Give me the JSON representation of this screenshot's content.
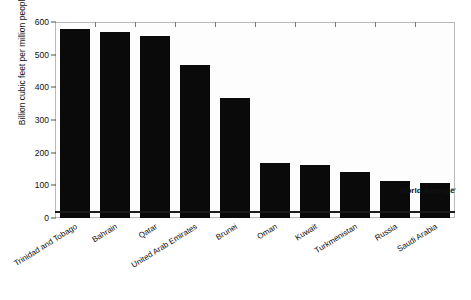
{
  "chart_data": {
    "type": "bar",
    "title": "",
    "subtitle": "",
    "xlabel": "",
    "ylabel": "Billion cubic feet per million people",
    "ylim": [
      0,
      600
    ],
    "yticks": [
      0,
      100,
      200,
      300,
      400,
      500,
      600
    ],
    "grid": false,
    "legend_position": "none",
    "orientation": "vertical",
    "bar_color": "#0a0a0a",
    "plot_background": "#fdfdfd",
    "frame_color": "#b9b9b9",
    "categories": [
      "Trinidad and Tobago",
      "Bahrain",
      "Qatar",
      "United Arab Emirates",
      "Brunei",
      "Oman",
      "Kuwait",
      "Turkmenistan",
      "Russia",
      "Saudi Arabia"
    ],
    "values": [
      580,
      568,
      557,
      468,
      368,
      168,
      162,
      141,
      113,
      107
    ],
    "annotations": [
      {
        "name": "world-average",
        "label": "World Average",
        "type": "hline",
        "value": 18,
        "color": "#1b1b1b"
      }
    ]
  }
}
